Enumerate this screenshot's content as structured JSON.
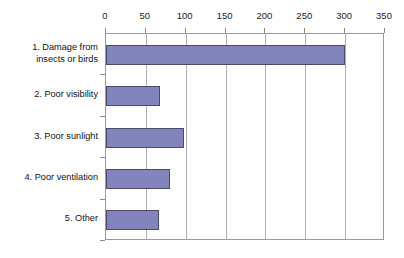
{
  "chart_data": {
    "type": "bar",
    "orientation": "horizontal",
    "title": "",
    "subtitle": "",
    "xlabel": "",
    "ylabel": "",
    "categories": [
      "1. Damage from\ninsects or birds",
      "2. Poor visibility",
      "3. Poor sunlight",
      "4. Poor ventilation",
      "5. Other"
    ],
    "values": [
      300,
      68,
      98,
      80,
      66
    ],
    "xlim": [
      0,
      350
    ],
    "xticks": [
      0,
      50,
      100,
      150,
      200,
      250,
      300,
      350
    ],
    "xtick_labels": [
      "0",
      "50",
      "100",
      "150",
      "200",
      "250",
      "300",
      "350"
    ],
    "grid": "vertical",
    "legend": "none",
    "bar_color": "#8185bc",
    "bar_edge_color": "#4b4b6b",
    "axis_color": "#9a9a9a",
    "grid_color": "#b0b0b0",
    "background": "#ffffff"
  }
}
